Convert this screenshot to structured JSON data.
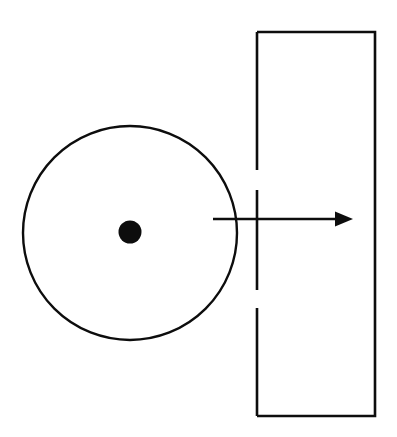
{
  "figure": {
    "type": "technical-line-diagram",
    "title": "",
    "canvas": {
      "width": 397,
      "height": 437,
      "background": "#ffffff"
    },
    "stroke_color": "#0d0d0d",
    "fill_color": "#0d0d0d",
    "shapes": {
      "circle": {
        "name": "circle-outline",
        "cx": 130,
        "cy": 233,
        "r": 107,
        "stroke_width": 2.4,
        "fill": "none"
      },
      "center_dot": {
        "name": "center-dot",
        "cx": 130,
        "cy": 232,
        "r": 11.5,
        "fill": "#0d0d0d"
      },
      "rectangle": {
        "name": "tall-rectangle",
        "x": 257,
        "y": 32,
        "width": 118,
        "height": 384,
        "stroke_width": 2.6,
        "fill": "none",
        "left_edge_broken": true,
        "left_edge_segments": [
          {
            "y1": 32,
            "y2": 170
          },
          {
            "y1": 190,
            "y2": 290
          },
          {
            "y1": 308,
            "y2": 416
          }
        ]
      },
      "arrow": {
        "name": "horizontal-arrow",
        "x1": 213,
        "y1": 219,
        "x2": 353,
        "y2": 219,
        "stroke_width": 2.6,
        "head_length": 18,
        "head_half_height": 7.5,
        "direction": "right"
      }
    }
  }
}
